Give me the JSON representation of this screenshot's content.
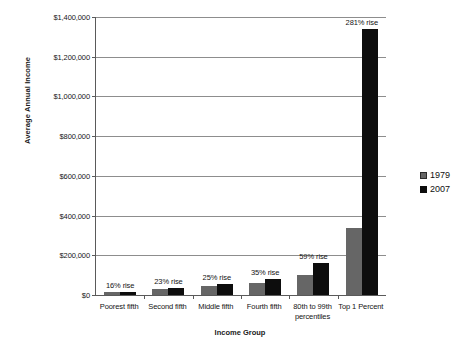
{
  "chart_data": {
    "type": "bar",
    "title": "",
    "xlabel": "Income Group",
    "ylabel": "Average Annual Income",
    "categories": [
      "Poorest fifth",
      "Second fifth",
      "Middle fifth",
      "Fourth fifth",
      "80th to 99th percentiles",
      "Top 1 Percent"
    ],
    "series": [
      {
        "name": "1979",
        "color": "#666666",
        "values": [
          15000,
          30000,
          43000,
          58000,
          100000,
          340000
        ]
      },
      {
        "name": "2007",
        "color": "#0d0d0d",
        "values": [
          17400,
          36900,
          53750,
          78300,
          159000,
          1340000
        ]
      }
    ],
    "annotations": [
      "16% rise",
      "23% rise",
      "25% rise",
      "35% rise",
      "59% rise",
      "281% rise"
    ],
    "ylim": [
      0,
      1400000
    ],
    "ytick_labels": [
      "$1,400,000",
      "$1,200,000",
      "$1,000,000",
      "$800,000",
      "$600,000",
      "$400,000",
      "$200,000",
      "$0"
    ],
    "ytick_values": [
      1400000,
      1200000,
      1000000,
      800000,
      600000,
      400000,
      200000,
      0
    ],
    "grid": true,
    "legend_position": "right"
  },
  "legend": {
    "items": [
      {
        "label": "1979",
        "color": "#666666"
      },
      {
        "label": "2007",
        "color": "#0d0d0d"
      }
    ]
  }
}
